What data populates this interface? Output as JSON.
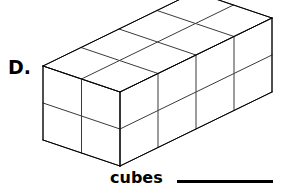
{
  "item": {
    "label": "D."
  },
  "prompt": {
    "unit_word": "cubes",
    "answer_blank": ""
  },
  "figure": {
    "name": "isometric-rectangular-prism",
    "stroke_color": "#3a3a3a",
    "dark_stroke_color": "#000000",
    "fill_color": "#ffffff",
    "stroke_width": 1,
    "dimensions": {
      "length_cubes": 4,
      "depth_cubes": 2,
      "height_cubes": 2,
      "total_cubes": 32
    },
    "projection": {
      "origin_x": 120,
      "origin_y": 166,
      "right_dx": 38,
      "right_dy": -18.5,
      "left_dx": -38.5,
      "left_dy": -13,
      "up_dy": -37
    }
  }
}
